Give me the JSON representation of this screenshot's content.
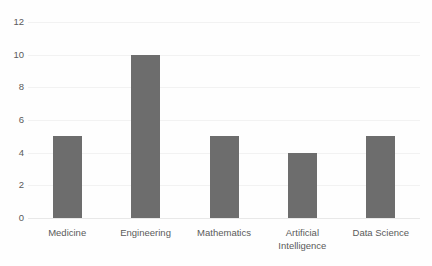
{
  "chart_data": {
    "type": "bar",
    "title": "",
    "subtitle": "",
    "xlabel": "",
    "ylabel": "",
    "categories": [
      "Medicine",
      "Engineering",
      "Mathematics",
      "Artificial Intelligence",
      "Data Science"
    ],
    "values": [
      5,
      10,
      5,
      4,
      5
    ],
    "ylim": [
      0,
      12
    ],
    "ytick_labels": [
      "0",
      "2",
      "4",
      "6",
      "8",
      "10",
      "12"
    ],
    "ytick_values": [
      0,
      2,
      4,
      6,
      8,
      10,
      12
    ],
    "grid": true,
    "grid_axis": "y",
    "legend": false,
    "legend_position": "none",
    "bar_color": "#6d6d6d",
    "gridline_color": "#f2f2f2",
    "axis_text_color": "#5a5a5a",
    "background_color": "#fefefe"
  }
}
